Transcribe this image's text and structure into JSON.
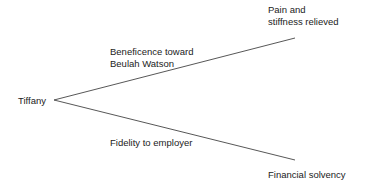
{
  "diagram": {
    "type": "decision-tree",
    "root": {
      "label": "Tiffany"
    },
    "branches": [
      {
        "edge_label_line1": "Beneficence toward",
        "edge_label_line2": "Beulah Watson",
        "outcome_line1": "Pain and",
        "outcome_line2": "stiffness relieved"
      },
      {
        "edge_label": "Fidelity to employer",
        "outcome": "Financial solvency"
      }
    ],
    "colors": {
      "line": "#444444",
      "text": "#222222",
      "background": "#ffffff"
    }
  }
}
